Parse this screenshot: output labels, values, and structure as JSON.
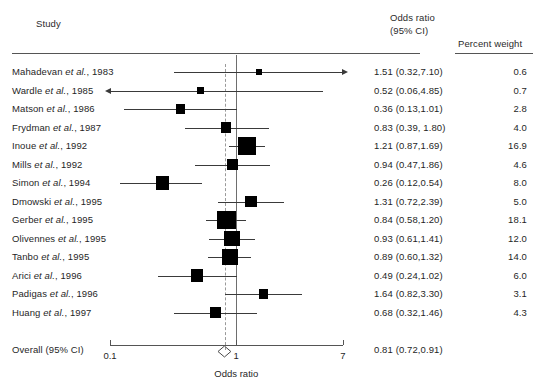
{
  "header": {
    "study_label": "Study",
    "or_line1": "Odds ratio",
    "or_line2": "(95% CI)",
    "weight_label": "Percent weight"
  },
  "axis": {
    "title": "Odds ratio",
    "ticks": [
      "0.1",
      "1",
      "7"
    ],
    "tick_values": [
      0.1,
      1,
      7
    ],
    "scale": "log",
    "min": 0.1,
    "max": 7
  },
  "overall": {
    "label": "Overall (95% CI)",
    "or_text": "0.81 (0.72,0.91)",
    "estimate": 0.81,
    "lower": 0.72,
    "upper": 0.91
  },
  "colors": {
    "marker": "#000000",
    "line": "#3a3a3a",
    "null_line": "#6e6e6e",
    "pooled_line": "#9a9a9a",
    "rule": "#555555",
    "text": "#1f1f1f",
    "background": "#ffffff"
  },
  "chart_data": {
    "type": "forest",
    "title": "",
    "xlabel": "Odds ratio",
    "ylabel": "",
    "xscale": "log",
    "xlim": [
      0.1,
      7
    ],
    "xticks": [
      0.1,
      1,
      7
    ],
    "xticklabels": [
      "0.1",
      "1",
      "7"
    ],
    "grid": false,
    "legend": "none",
    "null_value": 1,
    "pooled_reference_line": 0.81,
    "columns": [
      "Study",
      "Odds ratio (95% CI)",
      "Percent weight"
    ],
    "rows": [
      {
        "study": "Mahadevan",
        "study_suffix": "et al., 1983",
        "study_full": "Mahadevan et al., 1983",
        "or": 1.51,
        "lower": 0.32,
        "upper": 7.1,
        "or_text": "1.51 (0.32,7.10)",
        "weight": 0.6,
        "weight_text": "0.6",
        "clip_right": true,
        "clip_left": false
      },
      {
        "study": "Wardle",
        "study_suffix": "et al., 1985",
        "study_full": "Wardle et al., 1985",
        "or": 0.52,
        "lower": 0.06,
        "upper": 4.85,
        "or_text": "0.52 (0.06,4.85)",
        "weight": 0.7,
        "weight_text": "0.7",
        "clip_right": false,
        "clip_left": true
      },
      {
        "study": "Matson",
        "study_suffix": "et al., 1986",
        "study_full": "Matson et al., 1986",
        "or": 0.36,
        "lower": 0.13,
        "upper": 1.01,
        "or_text": "0.36 (0.13,1.01)",
        "weight": 2.8,
        "weight_text": "2.8",
        "clip_right": false,
        "clip_left": false
      },
      {
        "study": "Frydman",
        "study_suffix": "et al., 1987",
        "study_full": "Frydman et al., 1987",
        "or": 0.83,
        "lower": 0.39,
        "upper": 1.8,
        "or_text": "0.83 (0.39, 1.80)",
        "weight": 4.0,
        "weight_text": "4.0",
        "clip_right": false,
        "clip_left": false
      },
      {
        "study": "Inoue",
        "study_suffix": "et al., 1992",
        "study_full": "Inoue et al., 1992",
        "or": 1.21,
        "lower": 0.87,
        "upper": 1.69,
        "or_text": "1.21 (0.87,1.69)",
        "weight": 16.9,
        "weight_text": "16.9",
        "clip_right": false,
        "clip_left": false
      },
      {
        "study": "Mills",
        "study_suffix": "et al., 1992",
        "study_full": "Mills et al., 1992",
        "or": 0.94,
        "lower": 0.47,
        "upper": 1.86,
        "or_text": "0.94 (0.47,1.86)",
        "weight": 4.6,
        "weight_text": "4.6",
        "clip_right": false,
        "clip_left": false
      },
      {
        "study": "Simon",
        "study_suffix": "et al., 1994",
        "study_full": "Simon et al., 1994",
        "or": 0.26,
        "lower": 0.12,
        "upper": 0.54,
        "or_text": "0.26 (0.12,0.54)",
        "weight": 8.0,
        "weight_text": "8.0",
        "clip_right": false,
        "clip_left": false
      },
      {
        "study": "Dmowski",
        "study_suffix": "et al., 1995",
        "study_full": "Dmowski et al., 1995",
        "or": 1.31,
        "lower": 0.72,
        "upper": 2.39,
        "or_text": "1.31 (0.72,2.39)",
        "weight": 5.0,
        "weight_text": "5.0",
        "clip_right": false,
        "clip_left": false
      },
      {
        "study": "Gerber",
        "study_suffix": "et al., 1995",
        "study_full": "Gerber et al., 1995",
        "or": 0.84,
        "lower": 0.58,
        "upper": 1.2,
        "or_text": "0.84 (0.58,1.20)",
        "weight": 18.1,
        "weight_text": "18.1",
        "clip_right": false,
        "clip_left": false
      },
      {
        "study": "Olivennes",
        "study_suffix": "et al., 1995",
        "study_full": "Olivennes et al., 1995",
        "or": 0.93,
        "lower": 0.61,
        "upper": 1.41,
        "or_text": "0.93 (0.61,1.41)",
        "weight": 12.0,
        "weight_text": "12.0",
        "clip_right": false,
        "clip_left": false
      },
      {
        "study": "Tanbo",
        "study_suffix": "et al., 1995",
        "study_full": "Tanbo et al., 1995",
        "or": 0.89,
        "lower": 0.6,
        "upper": 1.32,
        "or_text": "0.89 (0.60,1.32)",
        "weight": 14.0,
        "weight_text": "14.0",
        "clip_right": false,
        "clip_left": false
      },
      {
        "study": "Arici",
        "study_suffix": "et al., 1996",
        "study_full": "Arici et al., 1996",
        "or": 0.49,
        "lower": 0.24,
        "upper": 1.02,
        "or_text": "0.49 (0.24,1.02)",
        "weight": 6.0,
        "weight_text": "6.0",
        "clip_right": false,
        "clip_left": false
      },
      {
        "study": "Padigas",
        "study_suffix": "et al., 1996",
        "study_full": "Padigas et al., 1996",
        "or": 1.64,
        "lower": 0.82,
        "upper": 3.3,
        "or_text": "1.64 (0.82,3.30)",
        "weight": 3.1,
        "weight_text": "3.1",
        "clip_right": false,
        "clip_left": false
      },
      {
        "study": "Huang",
        "study_suffix": "et al., 1997",
        "study_full": "Huang et al., 1997",
        "or": 0.68,
        "lower": 0.32,
        "upper": 1.46,
        "or_text": "0.68 (0.32,1.46)",
        "weight": 4.3,
        "weight_text": "4.3",
        "clip_right": false,
        "clip_left": false
      }
    ],
    "summary": {
      "label": "Overall (95% CI)",
      "or": 0.81,
      "lower": 0.72,
      "upper": 0.91,
      "or_text": "0.81 (0.72,0.91)"
    }
  }
}
